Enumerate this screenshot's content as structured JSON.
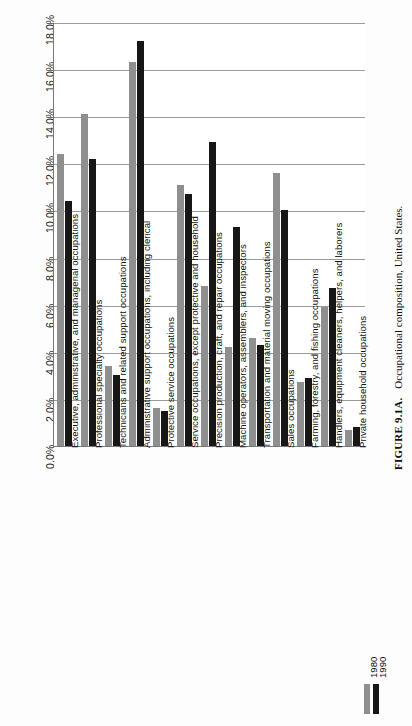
{
  "figure": {
    "number": "FIGURE 9.1A.",
    "caption": "Occupational composition, United States."
  },
  "legend": {
    "title": "",
    "items": [
      {
        "label": "1980",
        "color": "#8f8f8f"
      },
      {
        "label": "1990",
        "color": "#171717"
      }
    ]
  },
  "chart_data": {
    "type": "bar",
    "title": "Occupational composition, United States.",
    "xlabel": "",
    "ylabel": "",
    "ylim": [
      0,
      18
    ],
    "ytick_labels": [
      "0.0%",
      "2.0%",
      "4.0%",
      "6.0%",
      "8.0%",
      "10.0%",
      "12.0%",
      "14.0%",
      "16.0%",
      "18.0%"
    ],
    "ytick_values": [
      0,
      2,
      4,
      6,
      8,
      10,
      12,
      14,
      16,
      18
    ],
    "grid": true,
    "legend_position": "bottom-right",
    "orientation": "vertical-bars-rotated-page",
    "categories": [
      "Executive, administrative, and managerial occupations",
      "Professional specialty occupations",
      "Technicians and related support occupations",
      "Administrative support occupations, including clerical",
      "Protective service occupations",
      "Service occupations, except protective and household",
      "Precision production, craft, and repair occupations",
      "Machine operators, assemblers, and inspectors",
      "Transportation and material moving occupations",
      "Sales occupations",
      "Farming, forestry, and fishing occupations",
      "Handlers, equipment cleaners, helpers, and laborers",
      "Private household occupations"
    ],
    "series": [
      {
        "name": "1980",
        "color": "#8f8f8f",
        "values": [
          12.4,
          14.1,
          3.4,
          16.3,
          1.6,
          11.1,
          6.8,
          4.2,
          4.6,
          11.6,
          2.7,
          5.9,
          0.7
        ]
      },
      {
        "name": "1990",
        "color": "#171717",
        "values": [
          10.4,
          12.2,
          3.0,
          17.2,
          1.5,
          10.7,
          12.9,
          9.3,
          4.3,
          10.0,
          2.9,
          6.7,
          0.8
        ]
      }
    ]
  }
}
